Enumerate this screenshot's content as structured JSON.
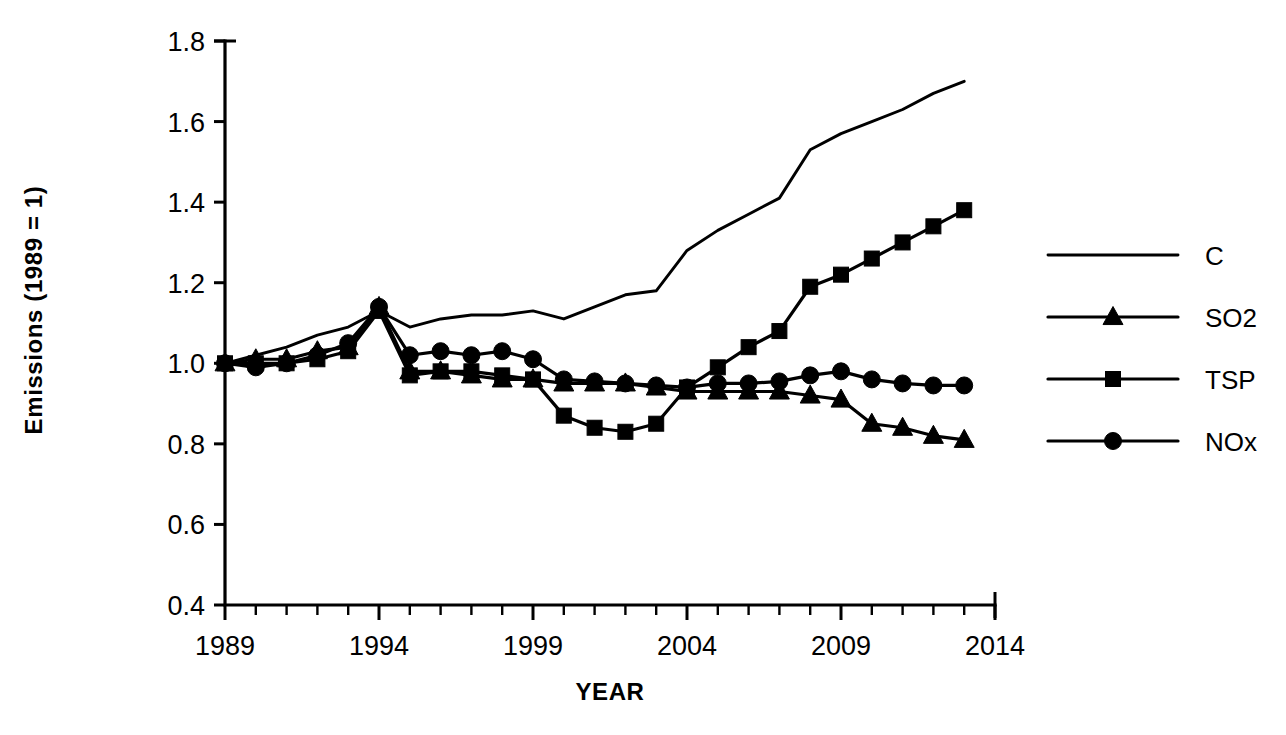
{
  "chart_data": {
    "type": "line",
    "title": "",
    "xlabel": "YEAR",
    "ylabel": "Emissions (1989 = 1)",
    "xlim": [
      1989,
      2014
    ],
    "ylim": [
      0.4,
      1.8
    ],
    "xticks": [
      1989,
      1994,
      1999,
      2004,
      2009,
      2014
    ],
    "xticklabels": [
      "1989",
      "1994",
      "1999",
      "2004",
      "2009",
      "2014"
    ],
    "yticks": [
      0.4,
      0.6,
      0.8,
      1.0,
      1.2,
      1.4,
      1.6,
      1.8
    ],
    "yticklabels": [
      "0.4",
      "0.6",
      "0.8",
      "1.0",
      "1.2",
      "1.4",
      "1.6",
      "1.8"
    ],
    "minor_xticks_interval": 1,
    "grid": false,
    "legend_position": "right",
    "x": [
      1989,
      1990,
      1991,
      1992,
      1993,
      1994,
      1995,
      1996,
      1997,
      1998,
      1999,
      2000,
      2001,
      2002,
      2003,
      2004,
      2005,
      2006,
      2007,
      2008,
      2009,
      2010,
      2011,
      2012,
      2013
    ],
    "series": [
      {
        "name": "C",
        "marker": "none",
        "values": [
          1.0,
          1.02,
          1.04,
          1.07,
          1.09,
          1.13,
          1.09,
          1.11,
          1.12,
          1.12,
          1.13,
          1.11,
          1.14,
          1.17,
          1.18,
          1.28,
          1.33,
          1.37,
          1.41,
          1.53,
          1.57,
          1.6,
          1.63,
          1.67,
          1.7
        ]
      },
      {
        "name": "SO2",
        "marker": "triangle",
        "values": [
          1.0,
          1.01,
          1.01,
          1.03,
          1.04,
          1.14,
          0.98,
          0.98,
          0.97,
          0.96,
          0.96,
          0.95,
          0.95,
          0.95,
          0.94,
          0.93,
          0.93,
          0.93,
          0.93,
          0.92,
          0.91,
          0.85,
          0.84,
          0.82,
          0.81
        ]
      },
      {
        "name": "TSP",
        "marker": "square",
        "values": [
          1.0,
          1.0,
          1.0,
          1.01,
          1.03,
          1.13,
          0.97,
          0.98,
          0.98,
          0.97,
          0.96,
          0.87,
          0.84,
          0.83,
          0.85,
          0.94,
          0.99,
          1.04,
          1.08,
          1.19,
          1.22,
          1.26,
          1.3,
          1.34,
          1.38
        ]
      },
      {
        "name": "NOx",
        "marker": "circle",
        "values": [
          1.0,
          0.99,
          1.0,
          1.02,
          1.05,
          1.14,
          1.02,
          1.03,
          1.02,
          1.03,
          1.01,
          0.96,
          0.955,
          0.95,
          0.945,
          0.94,
          0.95,
          0.95,
          0.955,
          0.97,
          0.98,
          0.96,
          0.95,
          0.945,
          0.945
        ]
      }
    ]
  },
  "legend": {
    "items": [
      {
        "label": "C",
        "marker": "none"
      },
      {
        "label": "SO2",
        "marker": "triangle"
      },
      {
        "label": "TSP",
        "marker": "square"
      },
      {
        "label": "NOx",
        "marker": "circle"
      }
    ]
  },
  "colors": {
    "ink": "#000000",
    "background": "#ffffff"
  }
}
